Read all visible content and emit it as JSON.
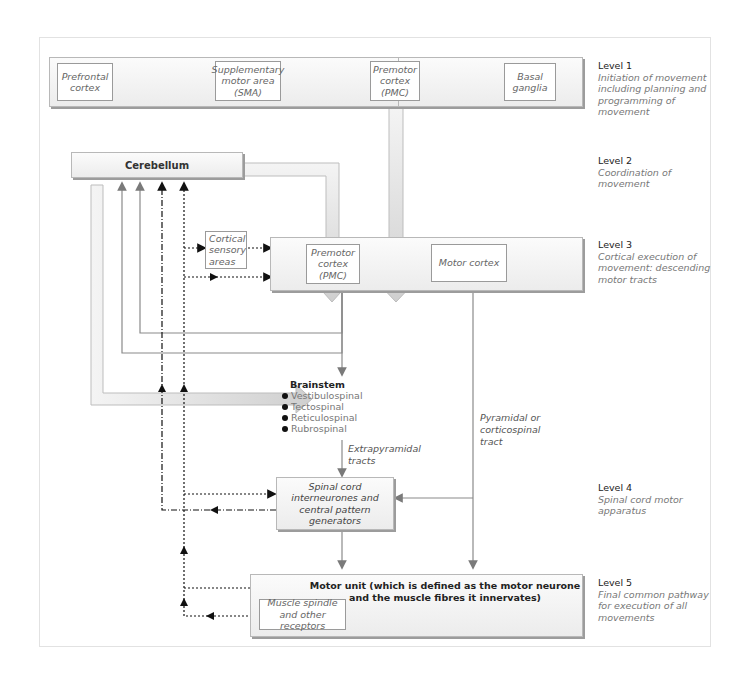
{
  "levels": [
    {
      "title": "Level 1",
      "desc": "Initiation of movement including planning and programming of movement"
    },
    {
      "title": "Level 2",
      "desc": "Coordination of movement"
    },
    {
      "title": "Level 3",
      "desc": "Cortical execution of movement: descending motor tracts"
    },
    {
      "title": "Level 4",
      "desc": "Spinal cord motor apparatus"
    },
    {
      "title": "Level 5",
      "desc": "Final common pathway for execution of all movements"
    }
  ],
  "level1_boxes": [
    {
      "label": "Prefrontal cortex"
    },
    {
      "label": "Supplementary motor area (SMA)"
    },
    {
      "label": "Premotor cortex (PMC)"
    },
    {
      "label": "Basal ganglia"
    }
  ],
  "cerebellum": {
    "label": "Cerebellum"
  },
  "cortical_sensory": {
    "label": "Cortical sensory areas"
  },
  "level3_boxes": [
    {
      "label": "Premotor cortex (PMC)"
    },
    {
      "label": "Motor cortex"
    }
  ],
  "brainstem": {
    "title": "Brainstem",
    "items": [
      "Vestibulospinal",
      "Tectospinal",
      "Reticulospinal",
      "Rubrospinal"
    ]
  },
  "tract_labels": {
    "extrapyramidal": "Extrapyramidal tracts",
    "pyramidal": "Pyramidal or corticospinal tract"
  },
  "spinal": {
    "label": "Spinal cord interneurones and central pattern generators"
  },
  "motor_unit": {
    "label": "Motor unit (which is defined as the motor neurone and the muscle fibres it innervates)"
  },
  "muscle_spindle": {
    "label": "Muscle spindle and other receptors"
  },
  "colors": {
    "line": "#8a8a8a",
    "arrow_fill": "#d8d8d8",
    "dotted": "#111111"
  }
}
